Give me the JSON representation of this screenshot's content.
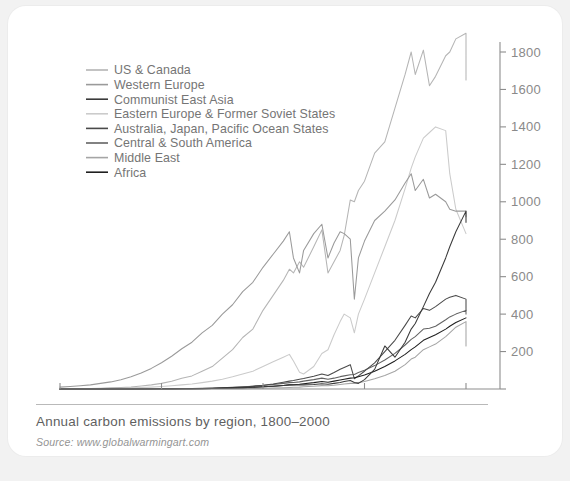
{
  "caption": {
    "title": "Annual carbon emissions by region, 1800–2000",
    "source": "Source: www.globalwarmingart.com"
  },
  "chart_data": {
    "type": "line",
    "title": "Annual carbon emissions by region, 1800–2000",
    "xlabel": "",
    "ylabel": "Million metric tons of carbon/year",
    "xlim": [
      1800,
      2000
    ],
    "ylim": [
      0,
      1800
    ],
    "xticks": [
      1800,
      1850,
      1900,
      1950,
      2000
    ],
    "yticks": [
      0,
      200,
      400,
      600,
      800,
      1000,
      1200,
      1400,
      1600,
      1800
    ],
    "ytick_labels": [
      "",
      "200",
      "400",
      "600",
      "800",
      "1000",
      "1200",
      "1400",
      "1600",
      "1800"
    ],
    "grid": false,
    "legend_position": "upper-left",
    "y_axis_side": "right",
    "x": [
      1800,
      1805,
      1810,
      1815,
      1820,
      1825,
      1830,
      1835,
      1840,
      1845,
      1850,
      1855,
      1860,
      1865,
      1870,
      1875,
      1880,
      1885,
      1890,
      1895,
      1900,
      1905,
      1910,
      1913,
      1915,
      1918,
      1920,
      1925,
      1929,
      1932,
      1935,
      1938,
      1940,
      1943,
      1945,
      1947,
      1950,
      1955,
      1960,
      1965,
      1970,
      1973,
      1975,
      1979,
      1982,
      1985,
      1990,
      1992,
      1995,
      2000
    ],
    "series": [
      {
        "name": "US & Canada",
        "color": "#b5b5b5",
        "values": [
          1,
          1,
          2,
          3,
          4,
          6,
          8,
          11,
          16,
          22,
          30,
          42,
          58,
          70,
          95,
          120,
          165,
          210,
          275,
          320,
          420,
          500,
          580,
          640,
          620,
          680,
          650,
          760,
          850,
          620,
          680,
          740,
          820,
          1010,
          1000,
          1060,
          1110,
          1260,
          1320,
          1500,
          1680,
          1800,
          1680,
          1810,
          1620,
          1670,
          1780,
          1800,
          1870,
          1900
        ],
        "final_value": 1650
      },
      {
        "name": "Western Europe",
        "color": "#9a9a9a",
        "values": [
          10,
          13,
          17,
          22,
          30,
          38,
          50,
          65,
          85,
          110,
          140,
          175,
          215,
          250,
          300,
          340,
          400,
          450,
          520,
          570,
          650,
          720,
          790,
          840,
          700,
          620,
          740,
          830,
          880,
          700,
          780,
          840,
          830,
          800,
          480,
          700,
          790,
          900,
          950,
          1010,
          1100,
          1150,
          1060,
          1120,
          1020,
          1040,
          1000,
          960,
          950,
          950
        ],
        "final_value": 920
      },
      {
        "name": "Communist East Asia",
        "color": "#3a3a3a",
        "values": [
          0,
          0,
          0,
          0,
          0,
          0,
          0,
          0,
          0,
          0,
          0,
          0,
          1,
          1,
          2,
          3,
          4,
          5,
          7,
          9,
          12,
          15,
          19,
          22,
          22,
          22,
          22,
          24,
          28,
          25,
          30,
          35,
          40,
          45,
          35,
          30,
          50,
          105,
          230,
          170,
          250,
          320,
          350,
          440,
          510,
          570,
          700,
          760,
          840,
          950
        ],
        "final_value": 890
      },
      {
        "name": "Eastern Europe & Former Soviet States",
        "color": "#cbcbcb",
        "values": [
          1,
          1,
          2,
          2,
          3,
          4,
          5,
          6,
          8,
          10,
          13,
          17,
          22,
          27,
          34,
          42,
          52,
          65,
          80,
          95,
          120,
          145,
          170,
          185,
          150,
          90,
          80,
          120,
          190,
          210,
          290,
          360,
          400,
          380,
          300,
          400,
          480,
          620,
          760,
          900,
          1070,
          1180,
          1240,
          1340,
          1370,
          1400,
          1380,
          1150,
          960,
          830
        ],
        "final_value": 830
      },
      {
        "name": "Australia, Japan, Pacific Ocean States",
        "color": "#4a4a4a",
        "values": [
          0,
          0,
          0,
          0,
          0,
          0,
          0,
          0,
          0,
          1,
          1,
          1,
          2,
          2,
          3,
          4,
          6,
          8,
          11,
          15,
          20,
          27,
          36,
          42,
          45,
          52,
          56,
          68,
          80,
          72,
          88,
          105,
          115,
          130,
          55,
          70,
          95,
          140,
          200,
          260,
          340,
          390,
          380,
          430,
          420,
          440,
          480,
          490,
          500,
          480
        ],
        "final_value": 420
      },
      {
        "name": "Central & South America",
        "color": "#636363",
        "values": [
          0,
          0,
          0,
          0,
          0,
          0,
          0,
          0,
          1,
          1,
          1,
          2,
          2,
          3,
          4,
          5,
          7,
          9,
          12,
          15,
          19,
          24,
          30,
          34,
          35,
          38,
          42,
          50,
          58,
          52,
          58,
          66,
          70,
          76,
          78,
          88,
          100,
          125,
          155,
          190,
          235,
          265,
          280,
          320,
          325,
          335,
          370,
          385,
          400,
          420
        ],
        "final_value": 400
      },
      {
        "name": "Middle East",
        "color": "#a5a5a5",
        "values": [
          0,
          0,
          0,
          0,
          0,
          0,
          0,
          0,
          0,
          0,
          0,
          0,
          0,
          0,
          1,
          1,
          1,
          2,
          2,
          3,
          4,
          5,
          7,
          8,
          9,
          10,
          12,
          15,
          18,
          17,
          20,
          24,
          27,
          30,
          30,
          34,
          40,
          55,
          72,
          95,
          130,
          160,
          170,
          210,
          225,
          240,
          280,
          300,
          330,
          360
        ],
        "final_value": 230
      },
      {
        "name": "Africa",
        "color": "#1f1f1f",
        "values": [
          0,
          0,
          0,
          0,
          0,
          0,
          0,
          0,
          0,
          0,
          1,
          1,
          1,
          2,
          2,
          3,
          4,
          5,
          7,
          9,
          12,
          15,
          19,
          22,
          23,
          25,
          28,
          34,
          40,
          36,
          42,
          48,
          52,
          58,
          60,
          66,
          75,
          95,
          120,
          150,
          185,
          210,
          225,
          260,
          275,
          290,
          320,
          335,
          355,
          380
        ],
        "final_value": 380
      }
    ]
  }
}
